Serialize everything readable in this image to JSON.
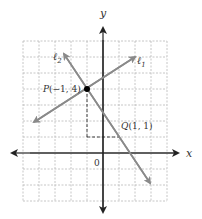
{
  "diagram": {
    "type": "coordinate-plane",
    "axes": {
      "x_label": "x",
      "y_label": "y",
      "origin_label": "0",
      "x_range": [
        -5,
        4
      ],
      "y_range": [
        -3,
        7
      ]
    },
    "grid": {
      "spacing_units": 1,
      "style": "dashed",
      "color": "#b5b5b5"
    },
    "points": [
      {
        "name": "P",
        "label": "P(−1, 4)",
        "x": -1,
        "y": 4
      },
      {
        "name": "Q",
        "label": "Q(1, 1)",
        "label_text": "Q(1, 1)",
        "x": 1,
        "y": 1
      }
    ],
    "lines": [
      {
        "name": "l1",
        "label": "ℓ",
        "subscript": "1",
        "slope": "2/3",
        "passes_through": "P"
      },
      {
        "name": "l2",
        "label": "ℓ",
        "subscript": "2",
        "slope": "-3/2",
        "passes_through": [
          "P",
          "Q"
        ]
      }
    ],
    "colors": {
      "axis": "#222222",
      "line": "#8a8a8a",
      "grid": "#b5b5b5",
      "point": "#000000"
    }
  }
}
